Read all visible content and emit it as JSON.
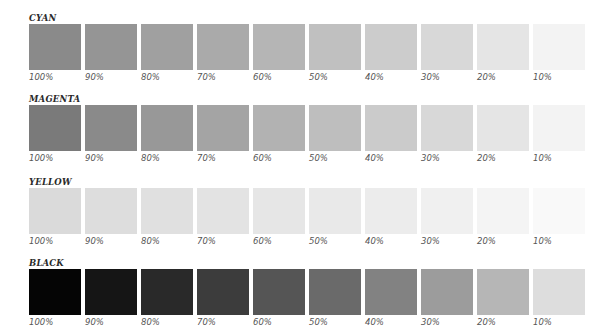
{
  "groups": [
    {
      "title": "CYAN",
      "top": 13,
      "swatches": [
        {
          "label": "100%",
          "color": "#8a8a8a"
        },
        {
          "label": "90%",
          "color": "#959595"
        },
        {
          "label": "80%",
          "color": "#a0a0a0"
        },
        {
          "label": "70%",
          "color": "#aaaaaa"
        },
        {
          "label": "60%",
          "color": "#b5b5b5"
        },
        {
          "label": "50%",
          "color": "#c0c0c0"
        },
        {
          "label": "40%",
          "color": "#cccccc"
        },
        {
          "label": "30%",
          "color": "#d8d8d8"
        },
        {
          "label": "20%",
          "color": "#e5e5e5"
        },
        {
          "label": "10%",
          "color": "#f3f3f3"
        }
      ]
    },
    {
      "title": "MAGENTA",
      "top": 94,
      "swatches": [
        {
          "label": "100%",
          "color": "#7a7a7a"
        },
        {
          "label": "90%",
          "color": "#8a8a8a"
        },
        {
          "label": "80%",
          "color": "#989898"
        },
        {
          "label": "70%",
          "color": "#a4a4a4"
        },
        {
          "label": "60%",
          "color": "#b2b2b2"
        },
        {
          "label": "50%",
          "color": "#bebebe"
        },
        {
          "label": "40%",
          "color": "#cbcbcb"
        },
        {
          "label": "30%",
          "color": "#d8d8d8"
        },
        {
          "label": "20%",
          "color": "#e5e5e5"
        },
        {
          "label": "10%",
          "color": "#f3f3f3"
        }
      ]
    },
    {
      "title": "YELLOW",
      "top": 177,
      "swatches": [
        {
          "label": "100%",
          "color": "#dadada"
        },
        {
          "label": "90%",
          "color": "#dddddd"
        },
        {
          "label": "80%",
          "color": "#e0e0e0"
        },
        {
          "label": "70%",
          "color": "#e3e3e3"
        },
        {
          "label": "60%",
          "color": "#e6e6e6"
        },
        {
          "label": "50%",
          "color": "#e9e9e9"
        },
        {
          "label": "40%",
          "color": "#ececec"
        },
        {
          "label": "30%",
          "color": "#f0f0f0"
        },
        {
          "label": "20%",
          "color": "#f4f4f4"
        },
        {
          "label": "10%",
          "color": "#f9f9f9"
        }
      ]
    },
    {
      "title": "BLACK",
      "top": 258,
      "swatches": [
        {
          "label": "100%",
          "color": "#050505"
        },
        {
          "label": "90%",
          "color": "#151515"
        },
        {
          "label": "80%",
          "color": "#292929"
        },
        {
          "label": "70%",
          "color": "#3c3c3c"
        },
        {
          "label": "60%",
          "color": "#555555"
        },
        {
          "label": "50%",
          "color": "#6a6a6a"
        },
        {
          "label": "40%",
          "color": "#828282"
        },
        {
          "label": "30%",
          "color": "#9c9c9c"
        },
        {
          "label": "20%",
          "color": "#b6b6b6"
        },
        {
          "label": "10%",
          "color": "#dddddd"
        }
      ]
    }
  ]
}
